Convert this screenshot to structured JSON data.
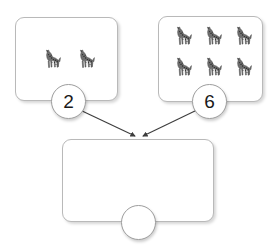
{
  "page": {
    "background_color": "#ffffff",
    "line_color": "#b9b9b9",
    "arrow_color": "#3d3d3d",
    "text_color": "#1a1a1a"
  },
  "groups": {
    "left": {
      "name": "first addend group",
      "item": "giraffe",
      "count": 2,
      "count_label": "2",
      "rows": 1,
      "columns": 2
    },
    "right": {
      "name": "second addend group",
      "item": "giraffe",
      "count": 6,
      "count_label": "6",
      "rows": 2,
      "columns": 3
    },
    "answer": {
      "name": "total group",
      "item": "giraffe",
      "count": 0,
      "count_label": "",
      "rows": 0,
      "columns": 0
    }
  },
  "arrows": [
    {
      "name": "left-to-total",
      "from": "circle-left",
      "to": "answer-box-top"
    },
    {
      "name": "right-to-total",
      "from": "circle-right",
      "to": "answer-box-top"
    }
  ],
  "icons": {
    "giraffe": "giraffe-icon"
  }
}
